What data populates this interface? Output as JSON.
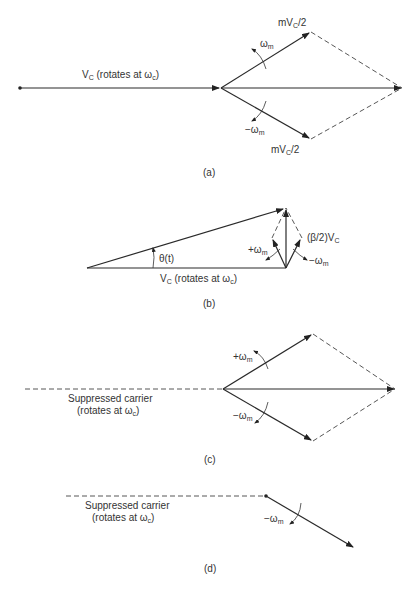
{
  "figure": {
    "panels": [
      {
        "id": "a",
        "caption": "(a)",
        "carrier_label": "V",
        "carrier_sub": "C",
        "carrier_suffix": " (rotates at ω",
        "carrier_suffix_sub": "c",
        "carrier_close": ")",
        "upper_label": "mV",
        "upper_label_sub": "C",
        "upper_label_suffix": "/2",
        "lower_label": "mV",
        "lower_label_sub": "C",
        "lower_label_suffix": "/2",
        "upper_rotation": "ω",
        "upper_rotation_sub": "m",
        "lower_rotation": "−ω",
        "lower_rotation_sub": "m"
      },
      {
        "id": "b",
        "caption": "(b)",
        "angle_label": "θ(t)",
        "carrier_label": "V",
        "carrier_sub": "C",
        "carrier_suffix": " (rotates at ω",
        "carrier_suffix_sub": "c",
        "carrier_close": ")",
        "sideband_label": "(β/2)V",
        "sideband_label_sub": "C",
        "left_rotation": "+ω",
        "left_rotation_sub": "m",
        "right_rotation": "−ω",
        "right_rotation_sub": "m"
      },
      {
        "id": "c",
        "caption": "(c)",
        "carrier_line1": "Suppressed carrier",
        "carrier_line2": "(rotates at ω",
        "carrier_line2_sub": "c",
        "carrier_line2_close": ")",
        "upper_rotation": "+ω",
        "upper_rotation_sub": "m",
        "lower_rotation": "−ω",
        "lower_rotation_sub": "m"
      },
      {
        "id": "d",
        "caption": "(d)",
        "carrier_line1": "Suppressed carrier",
        "carrier_line2": "(rotates at ω",
        "carrier_line2_sub": "c",
        "carrier_line2_close": ")",
        "rotation": "−ω",
        "rotation_sub": "m"
      }
    ]
  }
}
